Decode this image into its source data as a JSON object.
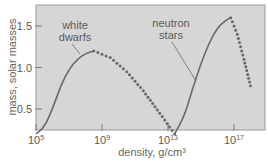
{
  "chart_data": {
    "type": "line",
    "title": "",
    "xlabel": "density, g/cm³",
    "ylabel": "mass, solar masses",
    "x_scale": "log10",
    "xlim_log10": [
      5,
      18
    ],
    "ylim": [
      0,
      1.75
    ],
    "grid": false,
    "x_ticks": [
      {
        "value_log10": 5,
        "base": "10",
        "exp": "5"
      },
      {
        "value_log10": 9,
        "base": "10",
        "exp": "9"
      },
      {
        "value_log10": 13,
        "base": "10",
        "exp": "13"
      },
      {
        "value_log10": 17,
        "base": "10",
        "exp": "17"
      }
    ],
    "y_ticks": [
      {
        "value": 0.5,
        "label": "0.5"
      },
      {
        "value": 1.0,
        "label": "1.0"
      },
      {
        "value": 1.5,
        "label": "1.5"
      }
    ],
    "series": [
      {
        "name": "white dwarfs",
        "style": "solid",
        "x_log10": [
          5.0,
          5.5,
          6.0,
          6.5,
          7.0,
          7.5,
          8.0,
          8.5
        ],
        "y": [
          0.2,
          0.28,
          0.5,
          0.78,
          0.98,
          1.1,
          1.17,
          1.2
        ]
      },
      {
        "name": "unstable (white dwarf branch)",
        "style": "dotted",
        "x_log10": [
          8.5,
          9.5,
          10.5,
          11.5,
          12.5,
          13.4
        ],
        "y": [
          1.2,
          1.12,
          0.95,
          0.72,
          0.45,
          0.2
        ]
      },
      {
        "name": "neutron stars",
        "style": "solid",
        "x_log10": [
          13.4,
          14.0,
          14.5,
          15.0,
          15.5,
          16.0,
          16.5,
          16.8
        ],
        "y": [
          0.2,
          0.42,
          0.75,
          1.05,
          1.3,
          1.48,
          1.57,
          1.6
        ]
      },
      {
        "name": "unstable (neutron star branch)",
        "style": "dotted",
        "x_log10": [
          16.8,
          17.2,
          17.6,
          18.0
        ],
        "y": [
          1.6,
          1.4,
          1.1,
          0.78
        ]
      }
    ],
    "annotations": [
      {
        "text_lines": [
          "white",
          "dwarfs"
        ],
        "points_to": "white dwarfs curve"
      },
      {
        "text_lines": [
          "neutron",
          "stars"
        ],
        "points_to": "neutron stars curve"
      }
    ],
    "legend": "none (inline annotations)"
  },
  "labels": {
    "xlabel": "density, g/cm³",
    "ylabel": "mass, solar masses",
    "wd_line1": "white",
    "wd_line2": "dwarfs",
    "ns_line1": "neutron",
    "ns_line2": "stars"
  },
  "colors": {
    "plot_bg": "#d6d6d6",
    "axis": "#7a7a7a",
    "curve": "#6a6a6a",
    "text": "#5a5a5a"
  }
}
